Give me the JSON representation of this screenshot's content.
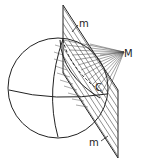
{
  "diagram": {
    "labels": {
      "point_M": "M",
      "point_C": "C",
      "plane_top": "m",
      "plane_bottom": "m"
    },
    "colors": {
      "stroke": "#222222",
      "background": "#ffffff"
    }
  }
}
